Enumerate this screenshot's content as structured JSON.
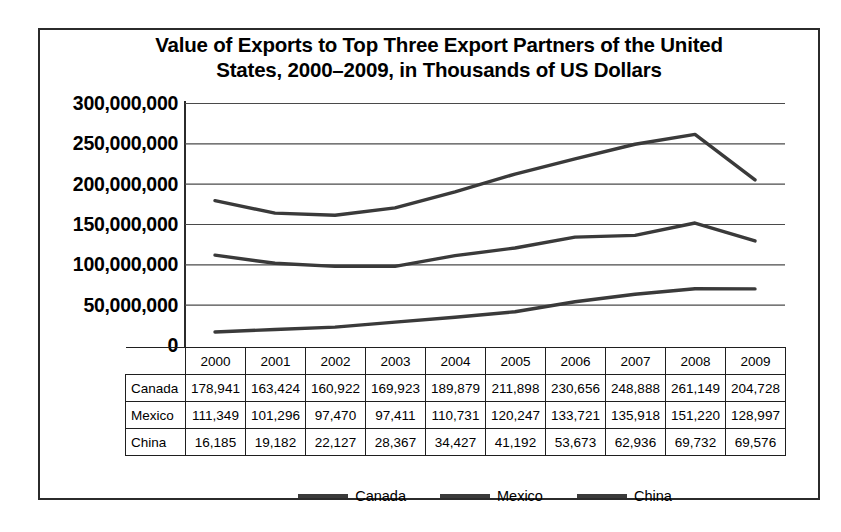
{
  "chart_data": {
    "type": "line",
    "title": "Value of Exports to Top Three Export Partners of the United States, 2000–2009, in Thousands of US Dollars",
    "title_line1": "Value of Exports to Top Three Export Partners of the United",
    "title_line2": "States, 2000–2009, in Thousands of US Dollars",
    "xlabel": "",
    "ylabel": "",
    "grid": true,
    "legend_position": "bottom",
    "ylim": [
      0,
      300000000
    ],
    "ytick_step": 50000000,
    "ytick_labels": [
      "300,000,000",
      "250,000,000",
      "200,000,000",
      "150,000,000",
      "100,000,000",
      "50,000,000",
      "0"
    ],
    "ytick_values": [
      300000000,
      250000000,
      200000000,
      150000000,
      100000000,
      50000000,
      0
    ],
    "categories": [
      "2000",
      "2001",
      "2002",
      "2003",
      "2004",
      "2005",
      "2006",
      "2007",
      "2008",
      "2009"
    ],
    "x": [
      2000,
      2001,
      2002,
      2003,
      2004,
      2005,
      2006,
      2007,
      2008,
      2009
    ],
    "note": "Values in table are thousands of US dollars; plotted values are absolute US dollars (table value x 1000).",
    "series": [
      {
        "name": "Canada",
        "color": "#3a3a3a",
        "values": [
          178941,
          163424,
          160922,
          169923,
          189879,
          211898,
          230656,
          248888,
          261149,
          204728
        ],
        "labels": [
          "178,941",
          "163,424",
          "160,922",
          "169,923",
          "189,879",
          "211,898",
          "230,656",
          "248,888",
          "261,149",
          "204,728"
        ]
      },
      {
        "name": "Mexico",
        "color": "#3a3a3a",
        "values": [
          111349,
          101296,
          97470,
          97411,
          110731,
          120247,
          133721,
          135918,
          151220,
          128997
        ],
        "labels": [
          "111,349",
          "101,296",
          "97,470",
          "97,411",
          "110,731",
          "120,247",
          "133,721",
          "135,918",
          "151,220",
          "128,997"
        ]
      },
      {
        "name": "China",
        "color": "#3a3a3a",
        "values": [
          16185,
          19182,
          22127,
          28367,
          34427,
          41192,
          53673,
          62936,
          69732,
          69576
        ],
        "labels": [
          "16,185",
          "19,182",
          "22,127",
          "28,367",
          "34,427",
          "41,192",
          "53,673",
          "62,936",
          "69,732",
          "69,576"
        ]
      }
    ]
  },
  "table": {
    "corner_label": "",
    "column_headers": [
      "2000",
      "2001",
      "2002",
      "2003",
      "2004",
      "2005",
      "2006",
      "2007",
      "2008",
      "2009"
    ],
    "rows": [
      {
        "label": "Canada",
        "cells": [
          "178,941",
          "163,424",
          "160,922",
          "169,923",
          "189,879",
          "211,898",
          "230,656",
          "248,888",
          "261,149",
          "204,728"
        ]
      },
      {
        "label": "Mexico",
        "cells": [
          "111,349",
          "101,296",
          "97,470",
          "97,411",
          "110,731",
          "120,247",
          "133,721",
          "135,918",
          "151,220",
          "128,997"
        ]
      },
      {
        "label": "China",
        "cells": [
          "16,185",
          "19,182",
          "22,127",
          "28,367",
          "34,427",
          "41,192",
          "53,673",
          "62,936",
          "69,732",
          "69,576"
        ]
      }
    ]
  },
  "legend": {
    "items": [
      {
        "label": "Canada",
        "color": "#3a3a3a"
      },
      {
        "label": "Mexico",
        "color": "#3a3a3a"
      },
      {
        "label": "China",
        "color": "#3a3a3a"
      }
    ]
  },
  "colors": {
    "frame": "#2b2b2b",
    "grid": "#4a4a4a",
    "series": "#3a3a3a",
    "background": "#ffffff"
  }
}
